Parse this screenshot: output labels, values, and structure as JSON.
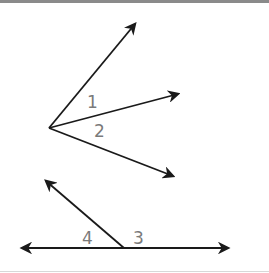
{
  "figure": {
    "top": {
      "vertex": [
        49,
        128
      ],
      "rays": [
        {
          "name": "upper",
          "to": [
            135,
            24
          ]
        },
        {
          "name": "middle",
          "to": [
            178,
            94
          ]
        },
        {
          "name": "lower",
          "to": [
            173,
            176
          ]
        }
      ],
      "labels": [
        {
          "text": "1",
          "x": 87,
          "y": 108
        },
        {
          "text": "2",
          "x": 94,
          "y": 137
        }
      ]
    },
    "bottom": {
      "line": {
        "from": [
          22,
          248
        ],
        "to": [
          228,
          248
        ]
      },
      "vertex": [
        124,
        248
      ],
      "ray": {
        "to": [
          46,
          181
        ]
      },
      "labels": [
        {
          "text": "4",
          "x": 82,
          "y": 244
        },
        {
          "text": "3",
          "x": 133,
          "y": 244
        }
      ]
    },
    "colors": {
      "line": "#1a1a1a",
      "label": "#7a7a7a",
      "top_border": "#8a8a8a"
    }
  }
}
